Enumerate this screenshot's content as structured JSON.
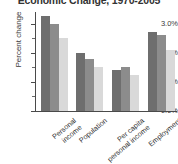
{
  "chart_data": {
    "type": "bar",
    "title": "Economic Change, 1970-2005",
    "xlabel": "",
    "ylabel": "Percent change",
    "ylim": [
      0.0,
      3.4
    ],
    "grid": false,
    "legend": "none",
    "ytick_labels": [
      "0.0%",
      "1.0%",
      "2.0%",
      "3.0%"
    ],
    "ytick_values": [
      0.0,
      1.0,
      2.0,
      3.0
    ],
    "minor_tick_values": [
      0.5,
      1.5,
      2.5
    ],
    "categories": [
      "Personal income",
      "Population",
      "Per capita personal income",
      "Employment"
    ],
    "category_lines": [
      [
        "Personal",
        "income"
      ],
      [
        "Population",
        ""
      ],
      [
        "Per capita",
        "personal income"
      ],
      [
        "Employment",
        ""
      ]
    ],
    "series": [
      {
        "name": "series-1",
        "color": "#6e6e6e",
        "values": [
          3.25,
          2.0,
          1.4,
          2.7
        ]
      },
      {
        "name": "series-2",
        "color": "#8c8c8c",
        "values": [
          3.0,
          1.78,
          1.5,
          2.6
        ]
      },
      {
        "name": "series-3",
        "color": "#d9d9d9",
        "values": [
          2.5,
          1.5,
          1.25,
          2.1
        ]
      }
    ]
  },
  "axis": {
    "y_title": "Percent change"
  }
}
